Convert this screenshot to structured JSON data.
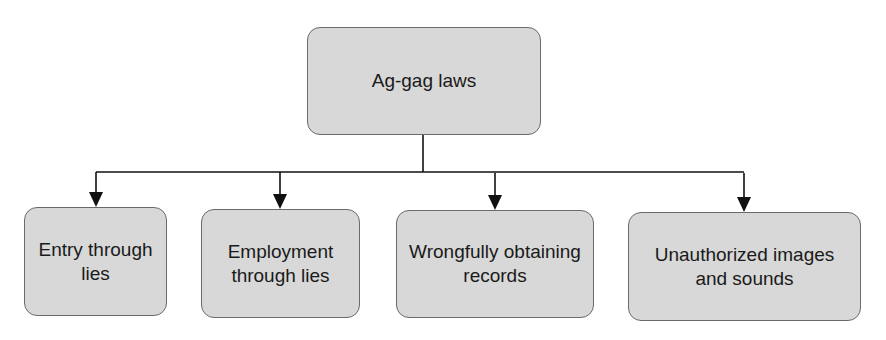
{
  "diagram": {
    "type": "hierarchy",
    "root": {
      "label": "Ag-gag laws"
    },
    "children": [
      {
        "label": "Entry through lies"
      },
      {
        "label": "Employment through lies"
      },
      {
        "label": "Wrongfully obtaining records"
      },
      {
        "label": "Unauthorized images and sounds"
      }
    ],
    "edges": [
      {
        "from": "Ag-gag laws",
        "to": "Entry through lies",
        "style": "arrow"
      },
      {
        "from": "Ag-gag laws",
        "to": "Employment through lies",
        "style": "arrow"
      },
      {
        "from": "Ag-gag laws",
        "to": "Wrongfully obtaining records",
        "style": "arrow"
      },
      {
        "from": "Ag-gag laws",
        "to": "Unauthorized images and sounds",
        "style": "arrow"
      }
    ],
    "colors": {
      "node_fill": "#d8d8d8",
      "node_border": "#6a6a6a",
      "connector": "#111111",
      "text": "#1a1a1a"
    }
  }
}
